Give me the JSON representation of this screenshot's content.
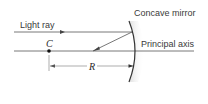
{
  "diagram": {
    "labels": {
      "mirror": "Concave mirror",
      "light_ray": "Light ray",
      "principal_axis": "Principal axis",
      "center": "C",
      "radius": "R"
    },
    "colors": {
      "line": "#4a4a4a",
      "text": "#3a3a3a",
      "mirror_shade": "#d8d8d8",
      "background": "#ffffff"
    }
  }
}
